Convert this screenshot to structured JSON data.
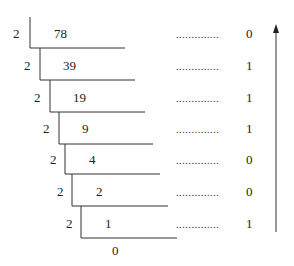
{
  "diagram": {
    "divisor": "2",
    "steps": [
      {
        "divisor": "2",
        "dividend": "78",
        "remainder": "0"
      },
      {
        "divisor": "2",
        "dividend": "39",
        "remainder": "1"
      },
      {
        "divisor": "2",
        "dividend": "19",
        "remainder": "1"
      },
      {
        "divisor": "2",
        "dividend": "9",
        "remainder": "1"
      },
      {
        "divisor": "2",
        "dividend": "4",
        "remainder": "0"
      },
      {
        "divisor": "2",
        "dividend": "2",
        "remainder": "0"
      },
      {
        "divisor": "2",
        "dividend": "1",
        "remainder": "1"
      }
    ],
    "final_quotient": "0",
    "dots": "..............",
    "arrow": "up-arrow",
    "colors": {
      "ink": "#222222",
      "background": "#ffffff"
    }
  }
}
